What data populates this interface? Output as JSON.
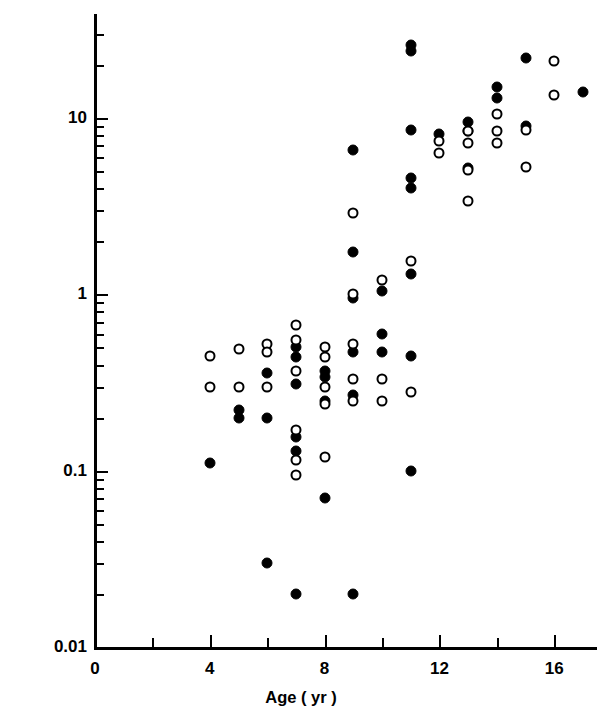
{
  "chart_data": {
    "type": "scatter",
    "title": "",
    "xlabel": "Age ( yr )",
    "ylabel": "Level of hLH in Serum (IU/l)",
    "xlim": [
      0,
      17.8
    ],
    "ylim": [
      0.01,
      30
    ],
    "yscale": "log",
    "xscale": "linear",
    "grid": false,
    "legend": "none",
    "xticks_major": [
      0,
      4,
      8,
      12,
      16
    ],
    "xticks_minor": [
      2,
      6,
      10,
      14
    ],
    "xtick_labels": [
      "0",
      "4",
      "8",
      "12",
      "16"
    ],
    "yticks_major": [
      0.01,
      0.1,
      1,
      10
    ],
    "ytick_labels": [
      "0.01",
      "0.1",
      "1",
      "10"
    ],
    "series": [
      {
        "name": "filled-circle",
        "marker": "filled circle",
        "color": "#000000",
        "points": [
          {
            "x": 4.0,
            "y": 0.11
          },
          {
            "x": 5.0,
            "y": 0.22
          },
          {
            "x": 5.0,
            "y": 0.2
          },
          {
            "x": 6.0,
            "y": 0.36
          },
          {
            "x": 6.0,
            "y": 0.2
          },
          {
            "x": 6.0,
            "y": 0.03
          },
          {
            "x": 7.0,
            "y": 0.5
          },
          {
            "x": 7.0,
            "y": 0.44
          },
          {
            "x": 7.0,
            "y": 0.31
          },
          {
            "x": 7.0,
            "y": 0.155
          },
          {
            "x": 7.0,
            "y": 0.13
          },
          {
            "x": 7.0,
            "y": 0.02
          },
          {
            "x": 8.0,
            "y": 0.37
          },
          {
            "x": 8.0,
            "y": 0.34
          },
          {
            "x": 8.0,
            "y": 0.25
          },
          {
            "x": 8.0,
            "y": 0.07
          },
          {
            "x": 9.0,
            "y": 6.6
          },
          {
            "x": 9.0,
            "y": 1.75
          },
          {
            "x": 9.0,
            "y": 0.95
          },
          {
            "x": 9.0,
            "y": 0.47
          },
          {
            "x": 9.0,
            "y": 0.27
          },
          {
            "x": 9.0,
            "y": 0.02
          },
          {
            "x": 10.0,
            "y": 1.05
          },
          {
            "x": 10.0,
            "y": 0.6
          },
          {
            "x": 10.0,
            "y": 0.47
          },
          {
            "x": 11.0,
            "y": 26.0
          },
          {
            "x": 11.0,
            "y": 24.0
          },
          {
            "x": 11.0,
            "y": 8.6
          },
          {
            "x": 11.0,
            "y": 4.6
          },
          {
            "x": 11.0,
            "y": 4.0
          },
          {
            "x": 11.0,
            "y": 1.3
          },
          {
            "x": 11.0,
            "y": 0.45
          },
          {
            "x": 11.0,
            "y": 0.1
          },
          {
            "x": 12.0,
            "y": 8.1
          },
          {
            "x": 13.0,
            "y": 9.5
          },
          {
            "x": 13.0,
            "y": 8.5
          },
          {
            "x": 13.0,
            "y": 5.2
          },
          {
            "x": 14.0,
            "y": 15.0
          },
          {
            "x": 14.0,
            "y": 13.0
          },
          {
            "x": 15.0,
            "y": 22.0
          },
          {
            "x": 15.0,
            "y": 9.0
          },
          {
            "x": 17.0,
            "y": 14.0
          }
        ]
      },
      {
        "name": "open-circle",
        "marker": "open circle",
        "color": "#000000",
        "points": [
          {
            "x": 4.0,
            "y": 0.45
          },
          {
            "x": 4.0,
            "y": 0.3
          },
          {
            "x": 5.0,
            "y": 0.49
          },
          {
            "x": 5.0,
            "y": 0.3
          },
          {
            "x": 6.0,
            "y": 0.52
          },
          {
            "x": 6.0,
            "y": 0.47
          },
          {
            "x": 6.0,
            "y": 0.3
          },
          {
            "x": 7.0,
            "y": 0.67
          },
          {
            "x": 7.0,
            "y": 0.55
          },
          {
            "x": 7.0,
            "y": 0.37
          },
          {
            "x": 7.0,
            "y": 0.17
          },
          {
            "x": 7.0,
            "y": 0.115
          },
          {
            "x": 7.0,
            "y": 0.095
          },
          {
            "x": 8.0,
            "y": 0.5
          },
          {
            "x": 8.0,
            "y": 0.44
          },
          {
            "x": 8.0,
            "y": 0.3
          },
          {
            "x": 8.0,
            "y": 0.24
          },
          {
            "x": 8.0,
            "y": 0.12
          },
          {
            "x": 9.0,
            "y": 2.9
          },
          {
            "x": 9.0,
            "y": 1.0
          },
          {
            "x": 9.0,
            "y": 0.52
          },
          {
            "x": 9.0,
            "y": 0.33
          },
          {
            "x": 9.0,
            "y": 0.25
          },
          {
            "x": 10.0,
            "y": 1.2
          },
          {
            "x": 10.0,
            "y": 0.33
          },
          {
            "x": 10.0,
            "y": 0.25
          },
          {
            "x": 11.0,
            "y": 1.55
          },
          {
            "x": 11.0,
            "y": 0.28
          },
          {
            "x": 12.0,
            "y": 7.4
          },
          {
            "x": 12.0,
            "y": 6.3
          },
          {
            "x": 13.0,
            "y": 8.4
          },
          {
            "x": 13.0,
            "y": 7.2
          },
          {
            "x": 13.0,
            "y": 5.1
          },
          {
            "x": 13.0,
            "y": 3.4
          },
          {
            "x": 14.0,
            "y": 10.6
          },
          {
            "x": 14.0,
            "y": 8.5
          },
          {
            "x": 14.0,
            "y": 7.2
          },
          {
            "x": 15.0,
            "y": 8.6
          },
          {
            "x": 15.0,
            "y": 5.3
          },
          {
            "x": 16.0,
            "y": 21.0
          },
          {
            "x": 16.0,
            "y": 13.5
          }
        ]
      }
    ]
  },
  "axes": {
    "x_label": "Age ( yr )",
    "y_label": "Level of hLH in Serum (IU/l)"
  }
}
